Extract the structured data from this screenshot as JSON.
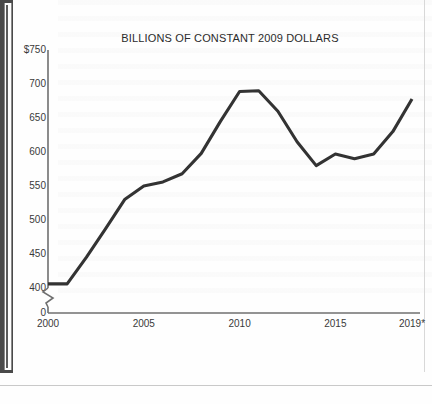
{
  "chart_data": {
    "type": "line",
    "title": "BILLIONS OF CONSTANT 2009 DOLLARS",
    "xlabel": "",
    "ylabel": "",
    "grid": false,
    "legend": null,
    "axis_break": true,
    "axis_break_note": "y-axis broken between 0 and 400",
    "xlim": [
      2000,
      2019
    ],
    "ylim": [
      400,
      750
    ],
    "y_baseline_tick": "0",
    "ytick_labels": [
      "$750",
      "700",
      "650",
      "600",
      "550",
      "500",
      "450",
      "400",
      "0"
    ],
    "ytick_values": [
      750,
      700,
      650,
      600,
      550,
      500,
      450,
      400,
      0
    ],
    "xtick_labels": [
      "2000",
      "2005",
      "2010",
      "2015",
      "2019*"
    ],
    "xtick_values": [
      2000,
      2005,
      2010,
      2015,
      2019
    ],
    "x": [
      2000,
      2001,
      2002,
      2003,
      2004,
      2005,
      2006,
      2007,
      2008,
      2009,
      2010,
      2011,
      2012,
      2013,
      2014,
      2015,
      2016,
      2017,
      2018,
      2019
    ],
    "values": [
      406,
      406,
      445,
      487,
      530,
      550,
      556,
      568,
      598,
      645,
      689,
      690,
      660,
      615,
      580,
      597,
      590,
      597,
      630,
      678
    ],
    "series": [
      {
        "name": "Billions of constant 2009 dollars",
        "color": "#333333",
        "values": [
          406,
          406,
          445,
          487,
          530,
          550,
          556,
          568,
          598,
          645,
          689,
          690,
          660,
          615,
          580,
          597,
          590,
          597,
          630,
          678
        ]
      }
    ],
    "footnote_marker": "*"
  },
  "style": {
    "line_color": "#333333",
    "axis_color": "#6f6f6f",
    "text_color": "#3a3a3a",
    "background": "#fefefe"
  }
}
